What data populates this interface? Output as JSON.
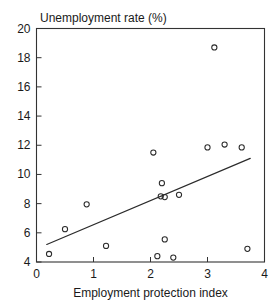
{
  "chart_data": {
    "type": "scatter",
    "title": "Unemployment rate (%)",
    "xlabel": "Employment protection index",
    "ylabel": "Unemployment rate (%)",
    "xlim": [
      0,
      4
    ],
    "ylim": [
      4,
      20
    ],
    "xticks": [
      "0",
      "1",
      "2",
      "3",
      "4"
    ],
    "xtick_values": [
      0,
      1,
      2,
      3,
      4
    ],
    "yticks": [
      "4",
      "6",
      "8",
      "10",
      "12",
      "14",
      "16",
      "18",
      "20"
    ],
    "ytick_values": [
      4,
      6,
      8,
      10,
      12,
      14,
      16,
      18,
      20
    ],
    "grid": false,
    "legend": "none",
    "marker_style": "open-circle",
    "points": [
      {
        "x": 0.22,
        "y": 4.55
      },
      {
        "x": 0.5,
        "y": 6.25
      },
      {
        "x": 0.88,
        "y": 7.95
      },
      {
        "x": 1.22,
        "y": 5.1
      },
      {
        "x": 2.05,
        "y": 11.5
      },
      {
        "x": 2.12,
        "y": 4.4
      },
      {
        "x": 2.2,
        "y": 9.4
      },
      {
        "x": 2.18,
        "y": 8.5
      },
      {
        "x": 2.25,
        "y": 8.45
      },
      {
        "x": 2.25,
        "y": 5.55
      },
      {
        "x": 2.4,
        "y": 4.3
      },
      {
        "x": 2.5,
        "y": 8.6
      },
      {
        "x": 3.0,
        "y": 11.85
      },
      {
        "x": 3.12,
        "y": 18.7
      },
      {
        "x": 3.3,
        "y": 12.05
      },
      {
        "x": 3.6,
        "y": 11.85
      },
      {
        "x": 3.7,
        "y": 4.9
      }
    ],
    "fit_line": {
      "type": "line",
      "x0": 0.18,
      "y0": 5.2,
      "x1": 3.75,
      "y1": 11.1
    }
  },
  "colors": {
    "axis": "#333333",
    "marker": "#2b2b2b",
    "line": "#2b2b2b",
    "background": "#ffffff"
  }
}
